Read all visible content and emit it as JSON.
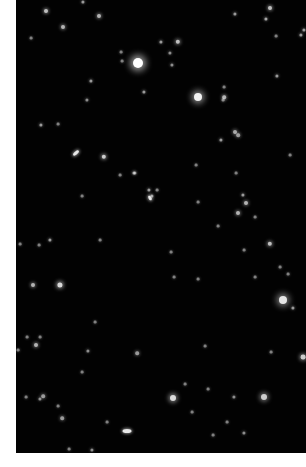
{
  "image": {
    "description": "Deep-sky star field photograph with scattered stars and small galaxies on black background",
    "background_color": "#020202",
    "margin_color": "#ffffff"
  },
  "stars": [
    {
      "x": 138,
      "y": 63,
      "r": 5,
      "b": 1.0
    },
    {
      "x": 198,
      "y": 97,
      "r": 4,
      "b": 0.95
    },
    {
      "x": 283,
      "y": 300,
      "r": 4,
      "b": 0.9
    },
    {
      "x": 173,
      "y": 398,
      "r": 3,
      "b": 0.85
    },
    {
      "x": 264,
      "y": 397,
      "r": 3,
      "b": 0.8
    },
    {
      "x": 60,
      "y": 285,
      "r": 2.6,
      "b": 0.85
    },
    {
      "x": 33,
      "y": 285,
      "r": 2,
      "b": 0.7
    },
    {
      "x": 104,
      "y": 157,
      "r": 2.2,
      "b": 0.8
    },
    {
      "x": 46,
      "y": 11,
      "r": 2,
      "b": 0.75
    },
    {
      "x": 63,
      "y": 27,
      "r": 2,
      "b": 0.7
    },
    {
      "x": 99,
      "y": 16,
      "r": 2,
      "b": 0.7
    },
    {
      "x": 91,
      "y": 81,
      "r": 1.6,
      "b": 0.6
    },
    {
      "x": 83,
      "y": 2,
      "r": 1.6,
      "b": 0.6
    },
    {
      "x": 121,
      "y": 52,
      "r": 1.4,
      "b": 0.5
    },
    {
      "x": 31,
      "y": 38,
      "r": 1.4,
      "b": 0.5
    },
    {
      "x": 122,
      "y": 61,
      "r": 1.4,
      "b": 0.5
    },
    {
      "x": 144,
      "y": 92,
      "r": 1.6,
      "b": 0.6
    },
    {
      "x": 41,
      "y": 125,
      "r": 1.6,
      "b": 0.6
    },
    {
      "x": 58,
      "y": 124,
      "r": 1.4,
      "b": 0.5
    },
    {
      "x": 87,
      "y": 100,
      "r": 1.6,
      "b": 0.55
    },
    {
      "x": 270,
      "y": 8,
      "r": 2,
      "b": 0.75
    },
    {
      "x": 266,
      "y": 19,
      "r": 1.6,
      "b": 0.65
    },
    {
      "x": 235,
      "y": 14,
      "r": 1.6,
      "b": 0.6
    },
    {
      "x": 178,
      "y": 42,
      "r": 2.2,
      "b": 0.75
    },
    {
      "x": 161,
      "y": 42,
      "r": 1.6,
      "b": 0.6
    },
    {
      "x": 172,
      "y": 65,
      "r": 1.6,
      "b": 0.55
    },
    {
      "x": 170,
      "y": 53,
      "r": 1.6,
      "b": 0.55
    },
    {
      "x": 224,
      "y": 87,
      "r": 1.4,
      "b": 0.5
    },
    {
      "x": 223,
      "y": 100,
      "r": 1.4,
      "b": 0.5
    },
    {
      "x": 224,
      "y": 97,
      "r": 1.8,
      "b": 0.7
    },
    {
      "x": 276,
      "y": 36,
      "r": 1.4,
      "b": 0.5
    },
    {
      "x": 277,
      "y": 76,
      "r": 1.6,
      "b": 0.6
    },
    {
      "x": 235,
      "y": 132,
      "r": 2,
      "b": 0.65
    },
    {
      "x": 238,
      "y": 135,
      "r": 1.8,
      "b": 0.6
    },
    {
      "x": 221,
      "y": 140,
      "r": 1.6,
      "b": 0.6
    },
    {
      "x": 301,
      "y": 35,
      "r": 1.6,
      "b": 0.6
    },
    {
      "x": 304,
      "y": 30,
      "r": 1.6,
      "b": 0.6
    },
    {
      "x": 290,
      "y": 155,
      "r": 1.4,
      "b": 0.5
    },
    {
      "x": 135,
      "y": 173,
      "r": 1.6,
      "b": 0.55
    },
    {
      "x": 149,
      "y": 190,
      "r": 1.6,
      "b": 0.6
    },
    {
      "x": 152,
      "y": 196,
      "r": 1.6,
      "b": 0.6
    },
    {
      "x": 50,
      "y": 240,
      "r": 1.6,
      "b": 0.6
    },
    {
      "x": 39,
      "y": 245,
      "r": 1.4,
      "b": 0.5
    },
    {
      "x": 20,
      "y": 244,
      "r": 1.4,
      "b": 0.5
    },
    {
      "x": 120,
      "y": 175,
      "r": 1.4,
      "b": 0.5
    },
    {
      "x": 82,
      "y": 196,
      "r": 1.4,
      "b": 0.5
    },
    {
      "x": 134,
      "y": 173,
      "r": 1.6,
      "b": 0.6
    },
    {
      "x": 100,
      "y": 240,
      "r": 1.4,
      "b": 0.5
    },
    {
      "x": 243,
      "y": 195,
      "r": 1.6,
      "b": 0.6
    },
    {
      "x": 246,
      "y": 203,
      "r": 2,
      "b": 0.7
    },
    {
      "x": 238,
      "y": 213,
      "r": 2,
      "b": 0.7
    },
    {
      "x": 270,
      "y": 244,
      "r": 2.2,
      "b": 0.75
    },
    {
      "x": 288,
      "y": 274,
      "r": 1.4,
      "b": 0.5
    },
    {
      "x": 280,
      "y": 267,
      "r": 1.4,
      "b": 0.5
    },
    {
      "x": 255,
      "y": 217,
      "r": 1.4,
      "b": 0.5
    },
    {
      "x": 236,
      "y": 173,
      "r": 1.4,
      "b": 0.5
    },
    {
      "x": 198,
      "y": 202,
      "r": 1.4,
      "b": 0.5
    },
    {
      "x": 218,
      "y": 226,
      "r": 1.4,
      "b": 0.5
    },
    {
      "x": 244,
      "y": 250,
      "r": 1.4,
      "b": 0.5
    },
    {
      "x": 196,
      "y": 165,
      "r": 1.4,
      "b": 0.5
    },
    {
      "x": 157,
      "y": 190,
      "r": 1.4,
      "b": 0.5
    },
    {
      "x": 171,
      "y": 252,
      "r": 1.4,
      "b": 0.5
    },
    {
      "x": 174,
      "y": 277,
      "r": 1.4,
      "b": 0.5
    },
    {
      "x": 198,
      "y": 279,
      "r": 1.4,
      "b": 0.5
    },
    {
      "x": 255,
      "y": 277,
      "r": 1.4,
      "b": 0.5
    },
    {
      "x": 293,
      "y": 308,
      "r": 1.6,
      "b": 0.6
    },
    {
      "x": 18,
      "y": 350,
      "r": 1.4,
      "b": 0.5
    },
    {
      "x": 36,
      "y": 345,
      "r": 2,
      "b": 0.7
    },
    {
      "x": 40,
      "y": 337,
      "r": 1.4,
      "b": 0.5
    },
    {
      "x": 27,
      "y": 337,
      "r": 1.4,
      "b": 0.5
    },
    {
      "x": 88,
      "y": 351,
      "r": 1.6,
      "b": 0.55
    },
    {
      "x": 95,
      "y": 322,
      "r": 1.4,
      "b": 0.5
    },
    {
      "x": 137,
      "y": 353,
      "r": 1.8,
      "b": 0.6
    },
    {
      "x": 40,
      "y": 399,
      "r": 1.6,
      "b": 0.55
    },
    {
      "x": 43,
      "y": 396,
      "r": 1.8,
      "b": 0.6
    },
    {
      "x": 26,
      "y": 397,
      "r": 1.4,
      "b": 0.5
    },
    {
      "x": 58,
      "y": 406,
      "r": 1.4,
      "b": 0.5
    },
    {
      "x": 62,
      "y": 418,
      "r": 1.8,
      "b": 0.6
    },
    {
      "x": 92,
      "y": 450,
      "r": 1.6,
      "b": 0.55
    },
    {
      "x": 69,
      "y": 449,
      "r": 1.4,
      "b": 0.5
    },
    {
      "x": 107,
      "y": 422,
      "r": 1.4,
      "b": 0.5
    },
    {
      "x": 82,
      "y": 372,
      "r": 1.4,
      "b": 0.5
    },
    {
      "x": 234,
      "y": 397,
      "r": 1.6,
      "b": 0.55
    },
    {
      "x": 244,
      "y": 433,
      "r": 1.6,
      "b": 0.55
    },
    {
      "x": 227,
      "y": 422,
      "r": 1.4,
      "b": 0.5
    },
    {
      "x": 205,
      "y": 346,
      "r": 1.4,
      "b": 0.5
    },
    {
      "x": 303,
      "y": 357,
      "r": 2.4,
      "b": 0.8
    },
    {
      "x": 271,
      "y": 352,
      "r": 1.4,
      "b": 0.5
    },
    {
      "x": 213,
      "y": 435,
      "r": 1.4,
      "b": 0.5
    },
    {
      "x": 192,
      "y": 412,
      "r": 1.4,
      "b": 0.5
    },
    {
      "x": 185,
      "y": 384,
      "r": 1.4,
      "b": 0.5
    },
    {
      "x": 208,
      "y": 389,
      "r": 1.4,
      "b": 0.5
    }
  ],
  "galaxies": [
    {
      "x": 76,
      "y": 153,
      "w": 7,
      "h": 3,
      "rot": -40
    },
    {
      "x": 127,
      "y": 431,
      "w": 9,
      "h": 4,
      "rot": 0
    },
    {
      "x": 150,
      "y": 198,
      "w": 5,
      "h": 3,
      "rot": 60
    }
  ]
}
